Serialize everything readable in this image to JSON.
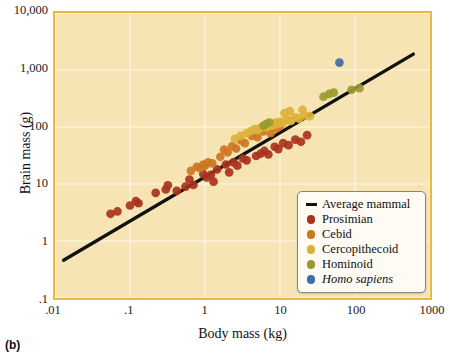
{
  "panel": {
    "label": "(b)"
  },
  "axes": {
    "xlabel": "Body mass (kg)",
    "ylabel": "Brain mass (g)",
    "xticks": [
      ".01",
      ".1",
      "1",
      "10",
      "100",
      "1000"
    ],
    "yticks": [
      ".1",
      "1",
      "10",
      "100",
      "1,000",
      "10,000"
    ]
  },
  "colors": {
    "plot_background": "#f6e4b4",
    "plot_border": "#e8b93f",
    "gridline": "#fbf2d8",
    "trendline": "#111111",
    "prosimian": "#a8321e",
    "cebid": "#cc7722",
    "cercopithecoid": "#ddb23a",
    "hominoid": "#9a9a30",
    "homo_sapiens": "#3d6fa8",
    "legend_background": "#fdfbf4",
    "legend_border": "#8a8576"
  },
  "legend": {
    "entries": [
      {
        "label": "Average mammal",
        "marker": "line",
        "color": "#111111",
        "italic": false
      },
      {
        "label": "Prosimian",
        "marker": "dot",
        "color": "#a8321e",
        "italic": false
      },
      {
        "label": "Cebid",
        "marker": "dot",
        "color": "#cc7722",
        "italic": false
      },
      {
        "label": "Cercopithecoid",
        "marker": "dot",
        "color": "#ddb23a",
        "italic": false
      },
      {
        "label": "Hominoid",
        "marker": "dot",
        "color": "#9a9a30",
        "italic": false
      },
      {
        "label": "Homo sapiens",
        "marker": "dot",
        "color": "#3d6fa8",
        "italic": true
      }
    ]
  },
  "chart_data": {
    "type": "scatter",
    "title": "",
    "xlabel": "Body mass (kg)",
    "ylabel": "Brain mass (g)",
    "xscale": "log",
    "yscale": "log",
    "xlim": [
      0.01,
      1000
    ],
    "ylim": [
      0.1,
      10000
    ],
    "grid": true,
    "legend_position": "bottom-right",
    "trendline": {
      "name": "Average mammal",
      "color": "#111111",
      "x": [
        0.013,
        600
      ],
      "y": [
        0.46,
        1900
      ]
    },
    "series": [
      {
        "name": "Prosimian",
        "color": "#a8321e",
        "points": [
          [
            0.055,
            3.0
          ],
          [
            0.068,
            3.3
          ],
          [
            0.1,
            4.2
          ],
          [
            0.12,
            5.0
          ],
          [
            0.13,
            4.6
          ],
          [
            0.22,
            7.0
          ],
          [
            0.3,
            8.0
          ],
          [
            0.32,
            9.5
          ],
          [
            0.42,
            7.6
          ],
          [
            0.55,
            9.0
          ],
          [
            0.62,
            12.0
          ],
          [
            0.7,
            9.6
          ],
          [
            0.95,
            15.0
          ],
          [
            1.05,
            13.0
          ],
          [
            1.2,
            14.5
          ],
          [
            1.3,
            11.0
          ],
          [
            1.45,
            18.0
          ],
          [
            1.9,
            22.0
          ],
          [
            2.1,
            16.0
          ],
          [
            2.4,
            24.0
          ],
          [
            2.7,
            21.0
          ],
          [
            3.2,
            28.0
          ],
          [
            3.6,
            26.0
          ],
          [
            4.8,
            31.0
          ],
          [
            5.5,
            34.0
          ],
          [
            6.2,
            38.0
          ],
          [
            7.0,
            33.0
          ],
          [
            8.5,
            45.0
          ],
          [
            9.5,
            41.0
          ],
          [
            11.0,
            52.0
          ],
          [
            13.0,
            48.0
          ],
          [
            16.0,
            60.0
          ],
          [
            19.0,
            55.0
          ],
          [
            23.0,
            72.0
          ]
        ]
      },
      {
        "name": "Cebid",
        "color": "#cc7722",
        "points": [
          [
            0.65,
            17.0
          ],
          [
            0.78,
            20.0
          ],
          [
            0.86,
            19.0
          ],
          [
            0.95,
            22.0
          ],
          [
            1.0,
            21.0
          ],
          [
            1.1,
            24.0
          ],
          [
            1.25,
            23.0
          ],
          [
            1.6,
            30.0
          ],
          [
            1.8,
            40.0
          ],
          [
            2.0,
            36.0
          ],
          [
            2.3,
            46.0
          ],
          [
            2.6,
            42.0
          ],
          [
            3.0,
            58.0
          ],
          [
            3.4,
            52.0
          ],
          [
            4.2,
            70.0
          ],
          [
            5.0,
            66.0
          ],
          [
            6.0,
            84.0
          ],
          [
            7.5,
            78.0
          ],
          [
            9.0,
            95.0
          ],
          [
            10.0,
            105.0
          ]
        ]
      },
      {
        "name": "Cercopithecoid",
        "color": "#ddb23a",
        "points": [
          [
            2.5,
            62.0
          ],
          [
            3.0,
            70.0
          ],
          [
            3.6,
            78.0
          ],
          [
            4.1,
            85.0
          ],
          [
            4.6,
            92.0
          ],
          [
            5.0,
            88.0
          ],
          [
            5.4,
            96.0
          ],
          [
            5.8,
            100.0
          ],
          [
            6.2,
            105.0
          ],
          [
            6.6,
            98.0
          ],
          [
            7.0,
            110.0
          ],
          [
            7.4,
            104.0
          ],
          [
            7.8,
            115.0
          ],
          [
            8.2,
            108.0
          ],
          [
            8.8,
            120.0
          ],
          [
            9.4,
            112.0
          ],
          [
            10.2,
            125.0
          ],
          [
            11.0,
            118.0
          ],
          [
            12.5,
            135.0
          ],
          [
            14.0,
            128.0
          ],
          [
            16.0,
            148.0
          ],
          [
            18.0,
            140.0
          ],
          [
            21.0,
            160.0
          ],
          [
            25.0,
            155.0
          ],
          [
            11.5,
            175.0
          ],
          [
            13.5,
            190.0
          ],
          [
            20.0,
            200.0
          ]
        ]
      },
      {
        "name": "Hominoid",
        "color": "#9a9a30",
        "points": [
          [
            6.0,
            105.0
          ],
          [
            6.5,
            112.0
          ],
          [
            7.2,
            120.0
          ],
          [
            38.0,
            340.0
          ],
          [
            45.0,
            380.0
          ],
          [
            52.0,
            400.0
          ],
          [
            90.0,
            450.0
          ],
          [
            115.0,
            480.0
          ]
        ]
      },
      {
        "name": "Homo sapiens",
        "color": "#3d6fa8",
        "points": [
          [
            62.0,
            1350.0
          ]
        ]
      }
    ]
  }
}
